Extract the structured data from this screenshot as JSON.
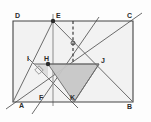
{
  "figure": {
    "width": 151,
    "height": 122,
    "background_color": "#fdfdfd",
    "rect_fill": "#f2f2f2",
    "shade_fill": "#c9c9c9",
    "stroke_color": "#555555",
    "thin_stroke_color": "#7a7a7a",
    "label_color": "#2b2b2b"
  },
  "points": {
    "A": {
      "label": "A",
      "x": 13,
      "y": 102,
      "label_x": 20,
      "label_y": 107
    },
    "B": {
      "label": "B",
      "x": 133,
      "y": 102,
      "label_x": 128,
      "label_y": 108
    },
    "C": {
      "label": "C",
      "x": 133,
      "y": 21,
      "label_x": 127,
      "label_y": 18
    },
    "D": {
      "label": "D",
      "x": 13,
      "y": 21,
      "label_x": 15,
      "label_y": 17
    },
    "E": {
      "label": "E",
      "x": 53,
      "y": 21,
      "label_x": 56,
      "label_y": 18
    },
    "F": {
      "label": "F",
      "x": 44,
      "y": 102,
      "label_x": 39,
      "label_y": 99
    },
    "H": {
      "label": "H",
      "x": 48,
      "y": 64,
      "label_x": 45,
      "label_y": 60
    },
    "I": {
      "label": "I",
      "x": 34,
      "y": 64,
      "label_x": 28,
      "label_y": 61
    },
    "J": {
      "label": "J",
      "x": 99,
      "y": 64,
      "label_x": 101,
      "label_y": 62
    },
    "K": {
      "label": "K",
      "x": 74,
      "y": 102,
      "label_x": 70,
      "label_y": 99
    },
    "M": {
      "label": "",
      "x": 73,
      "y": 43,
      "label_x": 0,
      "label_y": 0
    }
  },
  "shapes": {
    "rectangle": "13,21 133,21 133,102 13,102",
    "shaded_triangle": "48,64 99,64 74,102"
  },
  "segments": {
    "rect_top": {
      "x1": 13,
      "y1": 21,
      "x2": 133,
      "y2": 21
    },
    "rect_right": {
      "x1": 133,
      "y1": 21,
      "x2": 133,
      "y2": 102
    },
    "rect_bottom": {
      "x1": 13,
      "y1": 102,
      "x2": 133,
      "y2": 102
    },
    "rect_left": {
      "x1": 13,
      "y1": 21,
      "x2": 13,
      "y2": 102
    },
    "vertical_E": {
      "x1": 53,
      "y1": 14,
      "x2": 53,
      "y2": 106
    },
    "diag_A_C": {
      "x1": 6,
      "y1": 109,
      "x2": 142,
      "y2": 13
    },
    "diag_E_B": {
      "x1": 53,
      "y1": 21,
      "x2": 133,
      "y2": 102
    },
    "diag_E_K": {
      "x1": 53,
      "y1": 21,
      "x2": 99,
      "y2": 64
    },
    "line_A_E": {
      "x1": 13,
      "y1": 102,
      "x2": 53,
      "y2": 21
    },
    "line_F_E": {
      "x1": 32,
      "y1": 114,
      "x2": 99,
      "y2": 17
    },
    "line_I_K": {
      "x1": 28,
      "y1": 58,
      "x2": 78,
      "y2": 108
    },
    "line_I_J": {
      "x1": 34,
      "y1": 64,
      "x2": 99,
      "y2": 64
    },
    "line_H_K": {
      "x1": 48,
      "y1": 64,
      "x2": 74,
      "y2": 102
    },
    "line_J_K": {
      "x1": 99,
      "y1": 64,
      "x2": 74,
      "y2": 102
    },
    "line_I_H_low": {
      "x1": 34,
      "y1": 64,
      "x2": 48,
      "y2": 78
    },
    "dashed_M": {
      "x1": 73,
      "y1": 21,
      "x2": 73,
      "y2": 64
    }
  },
  "markers": {
    "right_angle": {
      "x": 34,
      "y": 71,
      "size": 6,
      "rotation": 45
    },
    "dot_E": {
      "x": 53,
      "y": 21,
      "r": 2.2
    },
    "dot_H": {
      "x": 48,
      "y": 64,
      "r": 2.2
    },
    "dot_M": {
      "x": 73,
      "y": 43,
      "r": 2.0
    }
  },
  "labels_order": [
    "D",
    "E",
    "C",
    "I",
    "H",
    "J",
    "A",
    "F",
    "K",
    "B"
  ]
}
